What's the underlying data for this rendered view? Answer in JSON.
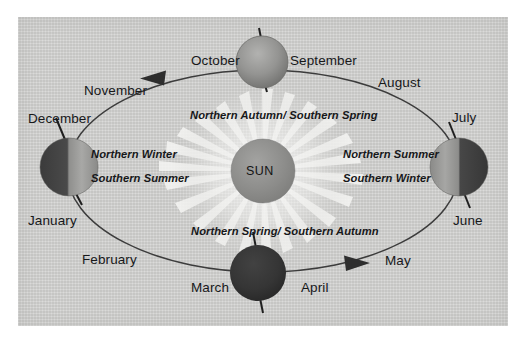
{
  "diagram": {
    "panel": {
      "background_color": "#d4d4d2",
      "border_color": "#c8c8c6"
    },
    "sun": {
      "label": "SUN",
      "color": "#8e8e8c",
      "rays_color": "#f2f2f0"
    },
    "orbit": {
      "stroke_color": "#3a3a3a",
      "direction": "counterclockwise"
    },
    "months": [
      {
        "name": "January",
        "x": 28,
        "y": 214
      },
      {
        "name": "February",
        "x": 82,
        "y": 253
      },
      {
        "name": "March",
        "x": 191,
        "y": 281
      },
      {
        "name": "April",
        "x": 301,
        "y": 281
      },
      {
        "name": "May",
        "x": 385,
        "y": 254
      },
      {
        "name": "June",
        "x": 453,
        "y": 214
      },
      {
        "name": "July",
        "x": 452,
        "y": 111
      },
      {
        "name": "August",
        "x": 378,
        "y": 76
      },
      {
        "name": "September",
        "x": 290,
        "y": 54
      },
      {
        "name": "October",
        "x": 191,
        "y": 54
      },
      {
        "name": "November",
        "x": 84,
        "y": 84
      },
      {
        "name": "December",
        "x": 28,
        "y": 112
      }
    ],
    "seasons": [
      {
        "text": "Northern Autumn/ Southern Spring",
        "x": 190,
        "y": 110,
        "position": "top"
      },
      {
        "text": "Northern Winter",
        "x": 91,
        "y": 149,
        "position": "left-upper"
      },
      {
        "text": "Southern Summer",
        "x": 91,
        "y": 173,
        "position": "left-lower"
      },
      {
        "text": "Northern Summer",
        "x": 343,
        "y": 149,
        "position": "right-upper"
      },
      {
        "text": "Southern Winter",
        "x": 343,
        "y": 173,
        "position": "right-lower"
      },
      {
        "text": "Northern Spring/ Southern Autumn",
        "x": 191,
        "y": 226,
        "position": "bottom"
      }
    ],
    "earths": [
      {
        "id": "earth-september-october",
        "position": "top",
        "lit_side": "full-lit",
        "note": "Sun-facing hemisphere toward viewer"
      },
      {
        "id": "earth-december-january",
        "position": "left",
        "lit_side": "right-lit",
        "note": "Northern Winter / Southern Summer"
      },
      {
        "id": "earth-june-july",
        "position": "right",
        "lit_side": "left-lit",
        "note": "Northern Summer / Southern Winter"
      },
      {
        "id": "earth-march-april",
        "position": "bottom",
        "lit_side": "full-dark",
        "note": "Night side toward viewer"
      }
    ],
    "arrowheads": [
      {
        "id": "arrow-top",
        "direction": "left",
        "x": 158,
        "y": 76
      },
      {
        "id": "arrow-bottom",
        "direction": "right",
        "x": 352,
        "y": 264
      }
    ]
  }
}
